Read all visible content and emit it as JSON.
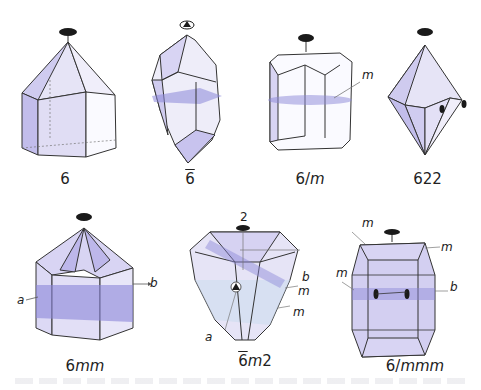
{
  "figure": {
    "colors": {
      "face_light": "#e6e4f6",
      "face_mid": "#cfcbef",
      "face_dark": "#b6b0e6",
      "mirror_plane": "#8a86d8",
      "edge": "#333333",
      "axis_symbol": "#1a1a1a"
    },
    "crystals": [
      {
        "id": "6",
        "caption": "6",
        "labels": []
      },
      {
        "id": "6bar",
        "caption_digit": "6",
        "caption_overline": true,
        "labels": []
      },
      {
        "id": "6/m",
        "caption_prefix": "6/",
        "caption_italic": "m",
        "labels": [
          "m"
        ]
      },
      {
        "id": "622",
        "caption": "622",
        "labels": []
      },
      {
        "id": "6mm",
        "caption_prefix": "6",
        "caption_italic": "mm",
        "labels": [
          "a",
          "b"
        ]
      },
      {
        "id": "6bar_m2",
        "caption_digit": "6",
        "caption_overline": true,
        "caption_italic": "m",
        "caption_suffix": "2",
        "labels": [
          "2",
          "a",
          "b",
          "m",
          "m"
        ]
      },
      {
        "id": "6/mmm",
        "caption_prefix": "6/",
        "caption_italic": "mmm",
        "labels": [
          "m",
          "m",
          "m",
          "b"
        ]
      }
    ]
  },
  "captions": {
    "c1": "6",
    "c2_digit": "6",
    "c3_prefix": "6/",
    "c3_italic": "m",
    "c4": "622",
    "c5_prefix": "6",
    "c5_italic": "mm",
    "c6_digit": "6",
    "c6_italic": "m",
    "c6_suffix": "2",
    "c7_prefix": "6/",
    "c7_italic": "mmm"
  },
  "labels": {
    "m_6m": "m",
    "a_6mm": "a",
    "b_6mm": "b",
    "two_6m2": "2",
    "a_6m2": "a",
    "b_6m2": "b",
    "m1_6m2": "m",
    "m2_6m2": "m",
    "m1_6mmm": "m",
    "m2_6mmm": "m",
    "m3_6mmm": "m",
    "b_6mmm": "b"
  }
}
